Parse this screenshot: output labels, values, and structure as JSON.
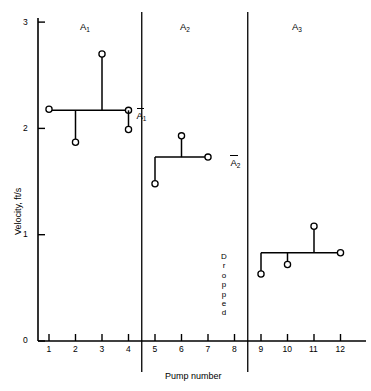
{
  "chart_data": {
    "type": "scatter",
    "title": "",
    "xlabel": "Pump number",
    "ylabel": "Velocity, ft/s",
    "xlim": [
      0,
      13
    ],
    "ylim": [
      0,
      3
    ],
    "x_ticks": [
      1,
      2,
      3,
      4,
      5,
      6,
      7,
      8,
      9,
      10,
      11,
      12
    ],
    "y_ticks": [
      0,
      1,
      2,
      3
    ],
    "grid": false,
    "legend": "none",
    "x": [
      1,
      2,
      3,
      4,
      5,
      6,
      9,
      10,
      11
    ],
    "values": [
      2.18,
      1.87,
      2.7,
      1.99,
      1.48,
      1.93,
      0.63,
      0.72,
      1.08
    ],
    "points": [
      {
        "pump": 1,
        "velocity": 2.18,
        "group": "A1"
      },
      {
        "pump": 2,
        "velocity": 1.87,
        "group": "A1"
      },
      {
        "pump": 3,
        "velocity": 2.7,
        "group": "A1"
      },
      {
        "pump": 4,
        "velocity": 1.99,
        "group": "A1"
      },
      {
        "pump": 5,
        "velocity": 1.48,
        "group": "A2"
      },
      {
        "pump": 6,
        "velocity": 1.93,
        "group": "A2"
      },
      {
        "pump": 9,
        "velocity": 0.63,
        "group": "A3"
      },
      {
        "pump": 10,
        "velocity": 0.72,
        "group": "A3"
      },
      {
        "pump": 11,
        "velocity": 1.08,
        "group": "A3"
      }
    ],
    "groups": [
      {
        "name": "A1",
        "label": "A",
        "sub": "1",
        "mean_label": "A",
        "mean_sub": "1",
        "mean": 2.17,
        "pumps": [
          1,
          2,
          3,
          4
        ],
        "mean_line_from": 1,
        "mean_line_to": 4
      },
      {
        "name": "A2",
        "label": "A",
        "sub": "2",
        "mean_label": "A",
        "mean_sub": "2",
        "mean": 1.73,
        "pumps": [
          5,
          6,
          7
        ],
        "mean_line_from": 5,
        "mean_line_to": 7
      },
      {
        "name": "A3",
        "label": "A",
        "sub": "3",
        "mean_label": "A",
        "mean_sub": "3",
        "mean": 0.83,
        "pumps": [
          9,
          10,
          11,
          12
        ],
        "mean_line_from": 9,
        "mean_line_to": 12
      }
    ],
    "annotations": [
      {
        "text": "Dropped",
        "pump": 8,
        "orientation": "vertical"
      }
    ],
    "separators": [
      4.5,
      8.5
    ]
  },
  "axes": {
    "y_title": "Velocity, ft/s",
    "x_title": "Pump number",
    "y_tick_labels": [
      "0",
      "1",
      "2",
      "3"
    ],
    "x_tick_labels": [
      "1",
      "2",
      "3",
      "4",
      "5",
      "6",
      "7",
      "8",
      "9",
      "10",
      "11",
      "12"
    ]
  },
  "group_labels": {
    "g1": "A",
    "g1_sub": "1",
    "g2": "A",
    "g2_sub": "2",
    "g3": "A",
    "g3_sub": "3"
  },
  "mean_labels": {
    "m1": "A",
    "m1_sub": "1",
    "m2": "A",
    "m2_sub": "2",
    "m3": "A",
    "m3_sub": "3"
  },
  "dropped": {
    "letters": [
      "D",
      "r",
      "o",
      "p",
      "p",
      "e",
      "d"
    ],
    "full": "Dropped"
  },
  "style": {
    "line_color": "#000000",
    "marker_fill": "#ffffff",
    "background": "#ffffff"
  }
}
